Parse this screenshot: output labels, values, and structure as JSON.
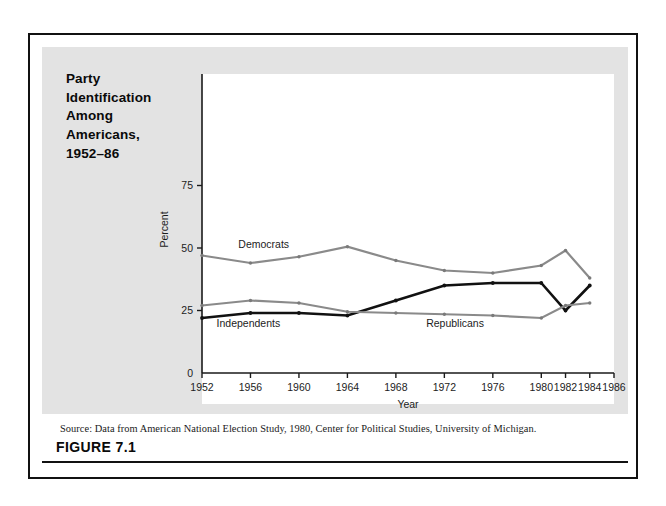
{
  "figure": {
    "title_lines": [
      "Party",
      "Identification",
      "Among",
      "Americans,",
      "1952–86"
    ],
    "caption": "FIGURE 7.1",
    "source": "Source: Data from American National Election Study, 1980, Center for Political Studies, University of Michigan."
  },
  "chart_data": {
    "type": "line",
    "title": "Party Identification Among Americans, 1952–86",
    "xlabel": "Year",
    "ylabel": "Percent",
    "x": [
      1952,
      1956,
      1960,
      1964,
      1968,
      1972,
      1976,
      1980,
      1982,
      1984
    ],
    "xticks": [
      1952,
      1956,
      1960,
      1964,
      1968,
      1972,
      1976,
      1980,
      1982,
      1984,
      1986
    ],
    "xtick_labels": [
      "1952",
      "1956",
      "1960",
      "1964",
      "1968",
      "1972",
      "1976",
      "1980",
      "1982",
      "1984",
      "1986"
    ],
    "xlim": [
      1952,
      1986
    ],
    "yticks": [
      0,
      25,
      50,
      75
    ],
    "ytick_labels": [
      "0",
      "25",
      "50",
      "75"
    ],
    "ylim": [
      0,
      80
    ],
    "grid": false,
    "legend_position": "inline-annotations",
    "series": [
      {
        "name": "Democrats",
        "color": "#8a8a8a",
        "label_x": 1955.0,
        "label_y": 50.0,
        "values": [
          47,
          44,
          46.5,
          50.5,
          45,
          41,
          40,
          43,
          49,
          38
        ]
      },
      {
        "name": "Independents",
        "color": "#111111",
        "label_x": 1953.2,
        "label_y": 18.5,
        "values": [
          22,
          24,
          24,
          23,
          29,
          35,
          36,
          36,
          25,
          35
        ]
      },
      {
        "name": "Republicans",
        "color": "#8a8a8a",
        "label_x": 1970.5,
        "label_y": 18.5,
        "values": [
          27,
          29,
          28,
          24.5,
          24,
          23.5,
          23,
          22,
          27,
          28
        ]
      }
    ]
  }
}
